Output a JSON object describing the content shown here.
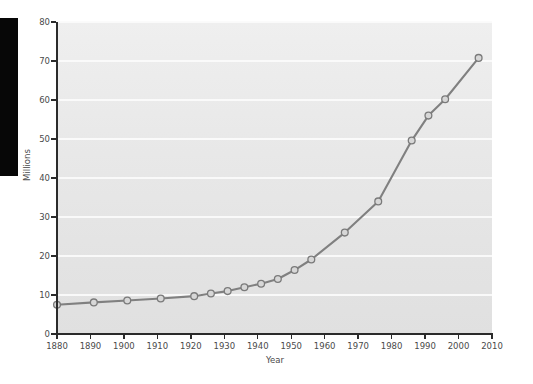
{
  "chart_data": {
    "type": "line",
    "title": "",
    "subtitle": "",
    "xlabel": "Year",
    "ylabel": "Millions",
    "xlim": [
      1880,
      2010
    ],
    "ylim": [
      0,
      80
    ],
    "grid": true,
    "legend": false,
    "legend_position": "none",
    "marker": "circle",
    "line_color": "#808080",
    "marker_fill": "#d7d7d7",
    "marker_edge": "#7a7a7a",
    "plot_background": "#e7e7e7",
    "gridline_color": "#fbfbfb",
    "axis_color": "#2b2b2b",
    "xticks": [
      1880,
      1890,
      1900,
      1910,
      1920,
      1930,
      1940,
      1950,
      1960,
      1970,
      1980,
      1990,
      2000,
      2010
    ],
    "yticks": [
      0,
      10,
      20,
      30,
      40,
      50,
      60,
      70,
      80
    ],
    "x": [
      1880,
      1891,
      1901,
      1911,
      1921,
      1926,
      1931,
      1936,
      1941,
      1946,
      1951,
      1956,
      1966,
      1976,
      1986,
      1991,
      1996,
      2006
    ],
    "values": [
      7.5,
      8.1,
      8.6,
      9.1,
      9.7,
      10.4,
      11.0,
      12.0,
      12.9,
      14.1,
      16.4,
      19.1,
      26.0,
      34.0,
      49.6,
      56.0,
      60.2,
      70.8
    ],
    "series": [
      {
        "name": "Millions",
        "values": [
          7.5,
          8.1,
          8.6,
          9.1,
          9.7,
          10.4,
          11.0,
          12.0,
          12.9,
          14.1,
          16.4,
          19.1,
          26.0,
          34.0,
          49.6,
          56.0,
          60.2,
          70.8
        ]
      }
    ]
  },
  "axis": {
    "y_tick_labels": [
      "0",
      "10",
      "20",
      "30",
      "40",
      "50",
      "60",
      "70",
      "80"
    ],
    "x_tick_labels": [
      "1880",
      "1890",
      "1900",
      "1910",
      "1920",
      "1930",
      "1940",
      "1950",
      "1960",
      "1970",
      "1980",
      "1990",
      "2000",
      "2010"
    ],
    "x_title": "Year",
    "y_title": "Millions"
  }
}
